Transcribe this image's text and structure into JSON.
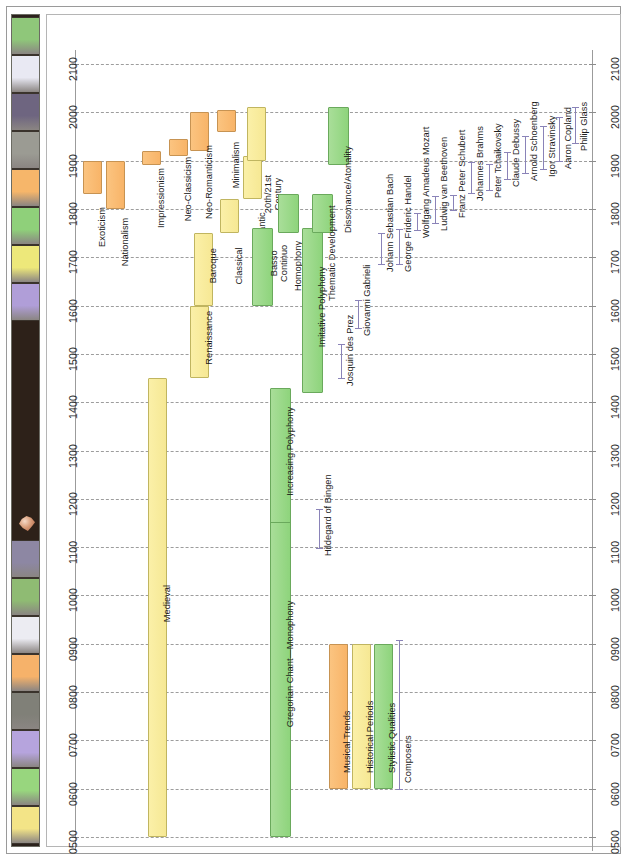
{
  "title": "Historical Overview",
  "emblem_icon": "shield-emblem-icon",
  "title_strip_swatches": [
    {
      "name": "swatch-green",
      "color": "#8fc77a"
    },
    {
      "name": "swatch-white",
      "color": "#e9e9f3"
    },
    {
      "name": "swatch-purple-gray",
      "color": "#6e6580"
    },
    {
      "name": "swatch-gray",
      "color": "#9b9b93"
    },
    {
      "name": "swatch-orange",
      "color": "#f6b66a"
    },
    {
      "name": "swatch-green-2",
      "color": "#8fd07a"
    },
    {
      "name": "swatch-yellow",
      "color": "#ede87a"
    },
    {
      "name": "swatch-lavender",
      "color": "#b09ed8"
    },
    {
      "name": "swatch-purple-gray-2",
      "color": "#8d87a3"
    },
    {
      "name": "swatch-green-3",
      "color": "#8fbb73"
    },
    {
      "name": "swatch-white-2",
      "color": "#ececf2"
    },
    {
      "name": "swatch-orange-2",
      "color": "#f6b26a"
    },
    {
      "name": "swatch-gray-2",
      "color": "#808078"
    },
    {
      "name": "swatch-lavender-2",
      "color": "#b6a4dd"
    },
    {
      "name": "swatch-green-4",
      "color": "#98d67e"
    },
    {
      "name": "swatch-yellow-2",
      "color": "#f3e487"
    }
  ],
  "axis": {
    "orientation": "vertical-reversed",
    "ticks": [
      "2100",
      "2000",
      "1900",
      "1800",
      "1700",
      "1600",
      "1500",
      "1400",
      "1300",
      "1200",
      "1100",
      "1000",
      "0900",
      "0800",
      "0700",
      "0600",
      "0500"
    ],
    "min": 500,
    "max": 2100,
    "left_axis_name": "year-axis-left",
    "right_axis_name": "year-axis-right"
  },
  "legend": {
    "items": [
      {
        "label": "Musical Trends",
        "type": "trend",
        "color": "#f8b468"
      },
      {
        "label": "Historical Periods",
        "type": "period",
        "color": "#f6e894"
      },
      {
        "label": "Stylistic Qualities",
        "type": "style",
        "color": "#8ed47c"
      },
      {
        "label": "Composers",
        "type": "composer",
        "color": "#8a83b8"
      }
    ]
  },
  "chart_data": {
    "type": "timeline",
    "title": "Historical Overview",
    "xlabel": "",
    "ylabel": "Year",
    "ylim": [
      500,
      2100
    ],
    "grid": true,
    "series": [
      {
        "name": "Musical Trends",
        "color": "#f8b468",
        "items": [
          {
            "label": "Exoticism",
            "start": 1830,
            "end": 1900,
            "track": 0
          },
          {
            "label": "Nationalism",
            "start": 1800,
            "end": 1900,
            "track": 1
          },
          {
            "label": "Impressionism",
            "start": 1890,
            "end": 1920,
            "track": 2
          },
          {
            "label": "Neo-Classicism",
            "start": 1910,
            "end": 1945,
            "track": 3
          },
          {
            "label": "Neo-Romanticism",
            "start": 1920,
            "end": 2000,
            "track": 4
          },
          {
            "label": "Minimalism",
            "start": 1960,
            "end": 2005,
            "track": 5
          }
        ]
      },
      {
        "name": "Historical Periods",
        "color": "#f6e894",
        "items": [
          {
            "label": "Medieval",
            "start": 500,
            "end": 1450,
            "track": 6
          },
          {
            "label": "Renaissance",
            "start": 1450,
            "end": 1600,
            "track": 7
          },
          {
            "label": "Baroque",
            "start": 1600,
            "end": 1750,
            "track": 8
          },
          {
            "label": "Classical",
            "start": 1750,
            "end": 1820,
            "track": 9
          },
          {
            "label": "Romantic",
            "start": 1820,
            "end": 1910,
            "track": 10
          },
          {
            "label": "20th/21st Century",
            "start": 1900,
            "end": 2010,
            "track": 11
          }
        ]
      },
      {
        "name": "Stylistic Qualities",
        "color": "#8ed47c",
        "items": [
          {
            "label": "Gregorian Chant—Monophony",
            "start": 500,
            "end": 1200,
            "track": 12
          },
          {
            "label": "Increasing Polyphony",
            "start": 1150,
            "end": 1430,
            "track": 13
          },
          {
            "label": "Basso Continuo",
            "start": 1600,
            "end": 1760,
            "track": 14
          },
          {
            "label": "Homophony",
            "start": 1750,
            "end": 1830,
            "track": 15
          },
          {
            "label": "Imitative Polyphony",
            "start": 1420,
            "end": 1760,
            "track": 16
          },
          {
            "label": "Dissonance/Atonality",
            "start": 1890,
            "end": 2010,
            "track": 17
          },
          {
            "label": "Thematic Development",
            "start": 1750,
            "end": 1830,
            "track": 18
          }
        ]
      },
      {
        "name": "Composers",
        "color": "#8a83b8",
        "items": [
          {
            "label": "Hildegard of Bingen",
            "start": 1098,
            "end": 1179,
            "track": 19
          },
          {
            "label": "Josquin des Prez",
            "start": 1450,
            "end": 1521,
            "track": 20
          },
          {
            "label": "Giovanni Gabrieli",
            "start": 1554,
            "end": 1612,
            "track": 21
          },
          {
            "label": "Johann Sebastian Bach",
            "start": 1685,
            "end": 1750,
            "track": 22
          },
          {
            "label": "George Frideric Handel",
            "start": 1685,
            "end": 1759,
            "track": 23
          },
          {
            "label": "Wolfgang Amadeus Mozart",
            "start": 1756,
            "end": 1791,
            "track": 24
          },
          {
            "label": "Ludwig van Beethoven",
            "start": 1770,
            "end": 1827,
            "track": 25
          },
          {
            "label": "Franz Peter Schubert",
            "start": 1797,
            "end": 1828,
            "track": 26
          },
          {
            "label": "Johannes Brahms",
            "start": 1833,
            "end": 1897,
            "track": 27
          },
          {
            "label": "Peter Tchaikovsky",
            "start": 1840,
            "end": 1893,
            "track": 28
          },
          {
            "label": "Claude Debussy",
            "start": 1862,
            "end": 1918,
            "track": 29
          },
          {
            "label": "Arnold Schoenberg",
            "start": 1874,
            "end": 1951,
            "track": 30
          },
          {
            "label": "Igor Stravinsky",
            "start": 1882,
            "end": 1971,
            "track": 31
          },
          {
            "label": "Aaron Copland",
            "start": 1900,
            "end": 1990,
            "track": 32
          },
          {
            "label": "Philip Glass",
            "start": 1937,
            "end": 2010,
            "track": 33
          }
        ]
      }
    ]
  }
}
